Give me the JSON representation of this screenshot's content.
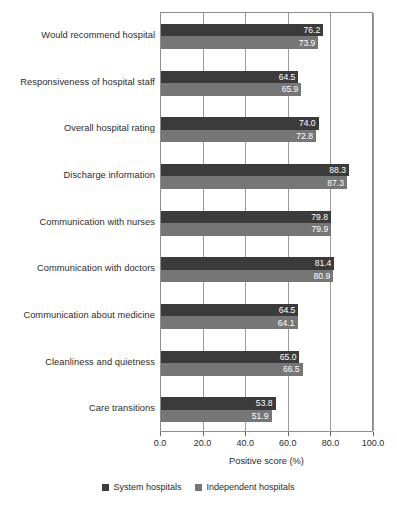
{
  "chart_data": {
    "type": "bar",
    "orientation": "horizontal",
    "title": "",
    "xlabel": "Positive score (%)",
    "ylabel": "",
    "xlim": [
      0,
      100
    ],
    "xticks": [
      "0.0",
      "20.0",
      "40.0",
      "60.0",
      "80.0",
      "100.0"
    ],
    "xtick_values": [
      0,
      20,
      40,
      60,
      80,
      100
    ],
    "grid": true,
    "legend_position": "bottom",
    "categories": [
      "Would recommend hospital",
      "Responsiveness of hospital staff",
      "Overall hospital rating",
      "Discharge information",
      "Communication with nurses",
      "Communication with doctors",
      "Communication about medicine",
      "Cleanliness and quietness",
      "Care transitions"
    ],
    "series": [
      {
        "name": "System hospitals",
        "color": "#3b3b3b",
        "values": [
          76.2,
          64.5,
          74.0,
          88.3,
          79.8,
          81.4,
          64.5,
          65.0,
          53.8
        ],
        "labels": [
          "76.2",
          "64.5",
          "74.0",
          "88.3",
          "79.8",
          "81.4",
          "64.5",
          "65.0",
          "53.8"
        ]
      },
      {
        "name": "Independent hospitals",
        "color": "#767676",
        "values": [
          73.9,
          65.9,
          72.8,
          87.3,
          79.9,
          80.9,
          64.1,
          66.5,
          51.9
        ],
        "labels": [
          "73.9",
          "65.9",
          "72.8",
          "87.3",
          "79.9",
          "80.9",
          "64.1",
          "66.5",
          "51.9"
        ]
      }
    ]
  }
}
